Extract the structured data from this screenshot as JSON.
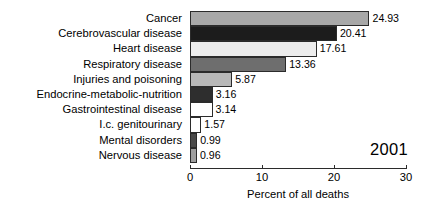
{
  "chart_data": {
    "type": "bar",
    "orientation": "horizontal",
    "title": "",
    "xlabel": "Percent of all deaths",
    "ylabel": "",
    "xlim": [
      0,
      30
    ],
    "xticks": [
      0,
      10,
      20,
      30
    ],
    "grid": false,
    "legend": false,
    "annotations": [
      {
        "name": "year",
        "text": "2001"
      }
    ],
    "categories": [
      "Cancer",
      "Cerebrovascular disease",
      "Heart disease",
      "Respiratory disease",
      "Injuries and poisoning",
      "Endocrine-metabolic-nutrition",
      "Gastrointestinal disease",
      "I.c. genitourinary",
      "Mental disorders",
      "Nervous disease"
    ],
    "values": [
      24.93,
      20.41,
      17.61,
      13.36,
      5.87,
      3.16,
      3.14,
      1.57,
      0.99,
      0.96
    ],
    "value_labels": [
      "24.93",
      "20.41",
      "17.61",
      "13.36",
      "5.87",
      "3.16",
      "3.14",
      "1.57",
      "0.99",
      "0.96"
    ],
    "bar_colors": [
      "#a8a8a8",
      "#1c1c1c",
      "#ededed",
      "#6e6e6e",
      "#b8b8b8",
      "#2e2e2e",
      "#ffffff",
      "#ffffff",
      "#4a4a4a",
      "#9e9e9e"
    ],
    "bar_edge_color": "#2b2b2b",
    "axis_color": "#2b2b2b",
    "background_color": "#ffffff"
  }
}
